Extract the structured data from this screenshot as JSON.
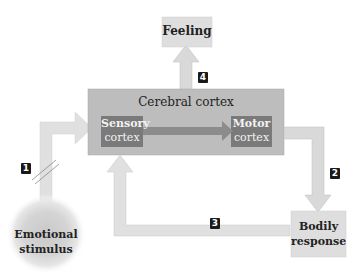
{
  "diagram": {
    "nodes": {
      "feeling": {
        "label": "Feeling"
      },
      "cerebral_cortex": {
        "label": "Cerebral cortex"
      },
      "sensory_cortex": {
        "line1": "Sensory",
        "line2": "cortex"
      },
      "motor_cortex": {
        "line1": "Motor",
        "line2": "cortex"
      },
      "emotional_stimulus": {
        "line1": "Emotional",
        "line2": "stimulus"
      },
      "bodily_response": {
        "line1": "Bodily",
        "line2": "response"
      }
    },
    "steps": [
      {
        "id": "1",
        "label": "1"
      },
      {
        "id": "2",
        "label": "2"
      },
      {
        "id": "3",
        "label": "3"
      },
      {
        "id": "4",
        "label": "4"
      }
    ],
    "colors": {
      "arrow": "#d9d9d9",
      "arrow_edge": "#c8c8c8",
      "cortex_box": "#bdbdbd",
      "inner_box": "#7a7a7a",
      "light_box": "#dedede",
      "badge": "#1a1a1a"
    }
  }
}
